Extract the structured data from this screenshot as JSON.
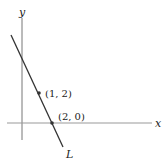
{
  "diagram": {
    "type": "coordinate-plane-line",
    "axes": {
      "x_label": "x",
      "y_label": "y"
    },
    "line": {
      "label": "L",
      "passes_through": [
        [
          1,
          2
        ],
        [
          2,
          0
        ]
      ]
    },
    "points": [
      {
        "label": "(1, 2)",
        "x": 1,
        "y": 2
      },
      {
        "label": "(2, 0)",
        "x": 2,
        "y": 0
      }
    ],
    "colors": {
      "axis": "#888888",
      "line": "#333333",
      "point": "#333333",
      "text": "#222222"
    }
  }
}
